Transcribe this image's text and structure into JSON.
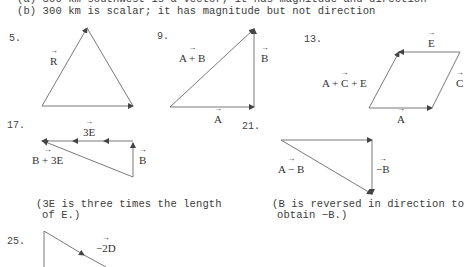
{
  "answers": {
    "line_a": "(a) 300 km southwest is a vector; it has magnitude and direction",
    "line_b": "(b) 300 km is scalar; it has magnitude but not direction"
  },
  "problems": [
    {
      "number": "5.",
      "labels": {
        "resultant": "R"
      }
    },
    {
      "number": "9.",
      "labels": {
        "sum": "A + B",
        "side_b": "B",
        "side_a": "A"
      }
    },
    {
      "number": "13.",
      "labels": {
        "top": "E",
        "right": "C",
        "bottom": "A",
        "sum": "A + C + E"
      }
    },
    {
      "number": "17.",
      "labels": {
        "top": "3E",
        "sum": "B + 3E",
        "side": "B"
      },
      "note_line1": "(3E is three times the length",
      "note_line2": "of E.)"
    },
    {
      "number": "21.",
      "labels": {
        "diff": "A − B",
        "side": "−B"
      },
      "note_line1": "(B is reversed in direction to",
      "note_line2": "obtain −B.)"
    },
    {
      "number": "25.",
      "labels": {
        "diag": "−2D"
      }
    }
  ],
  "colors": {
    "line": "#555555",
    "text": "#3b3b3b",
    "background": "#ffffff"
  }
}
